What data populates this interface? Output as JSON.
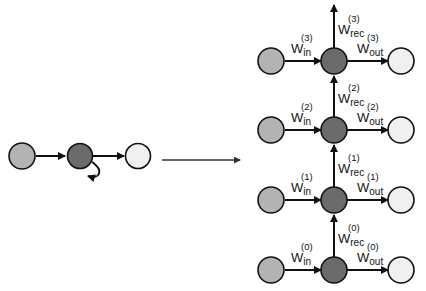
{
  "diagram": {
    "colors": {
      "input_node": "#b3b3b3",
      "hidden_node": "#6b6b6b",
      "output_node": "#f0f0f0",
      "stroke": "#111111"
    },
    "folded": {
      "nodes": [
        "input",
        "hidden",
        "output"
      ],
      "self_loop": "recurrent"
    },
    "transform_arrow": "unfold",
    "unrolled": {
      "steps": [
        {
          "t": "3",
          "w_in": "W",
          "w_in_sub": "in",
          "w_in_sup": "(3)",
          "w_out": "W",
          "w_out_sub": "out",
          "w_out_sup": "(3)",
          "w_rec": "W",
          "w_rec_sub": "rec",
          "w_rec_sup": "(3)"
        },
        {
          "t": "2",
          "w_in": "W",
          "w_in_sub": "in",
          "w_in_sup": "(2)",
          "w_out": "W",
          "w_out_sub": "out",
          "w_out_sup": "(2)",
          "w_rec": "W",
          "w_rec_sub": "rec",
          "w_rec_sup": "(2)"
        },
        {
          "t": "1",
          "w_in": "W",
          "w_in_sub": "in",
          "w_in_sup": "(1)",
          "w_out": "W",
          "w_out_sub": "out",
          "w_out_sup": "(1)",
          "w_rec": "W",
          "w_rec_sub": "rec",
          "w_rec_sup": "(1)"
        },
        {
          "t": "0",
          "w_in": "W",
          "w_in_sub": "in",
          "w_in_sup": "(0)",
          "w_out": "W",
          "w_out_sub": "out",
          "w_out_sup": "(0)",
          "w_rec": "W",
          "w_rec_sub": "rec",
          "w_rec_sup": "(0)"
        }
      ]
    }
  }
}
